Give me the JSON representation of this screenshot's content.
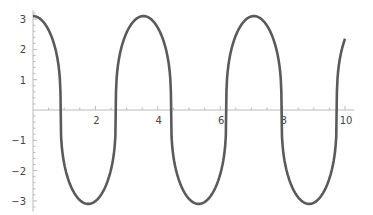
{
  "chart_data": {
    "type": "line",
    "title": "",
    "xlabel": "",
    "ylabel": "",
    "xlim": [
      0,
      10.2
    ],
    "ylim": [
      -3.2,
      3.2
    ],
    "x_ticks": [
      2,
      4,
      6,
      8,
      10
    ],
    "x_tick_labels": [
      "2",
      "4",
      "6",
      "8",
      "10"
    ],
    "y_ticks": [
      -3,
      -2,
      -1,
      1,
      2,
      3
    ],
    "y_tick_labels": [
      "−3",
      "−2",
      "−1",
      "1",
      "2",
      "3"
    ],
    "grid": false,
    "legend": null,
    "series": [
      {
        "name": "f(x)",
        "color": "#5a5a5a",
        "description": "periodic flat-topped oscillation, amplitude ~3.1, period ~3.55",
        "x": [
          0,
          0.5,
          0.93,
          1.3,
          1.8,
          2.3,
          2.7,
          3.1,
          3.6,
          4.1,
          4.47,
          4.85,
          5.35,
          5.85,
          6.24,
          6.6,
          7.1,
          7.6,
          8.01,
          8.4,
          8.9,
          9.4,
          9.78,
          10.0
        ],
        "y": [
          3.1,
          2.7,
          0,
          -2.7,
          -3.1,
          -2.7,
          0,
          2.7,
          3.1,
          2.7,
          0,
          -2.7,
          -3.1,
          -2.7,
          0,
          2.7,
          3.1,
          2.7,
          0,
          -2.7,
          -3.1,
          -2.7,
          0,
          2.5
        ]
      }
    ]
  }
}
